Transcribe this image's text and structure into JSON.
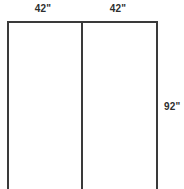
{
  "diagram": {
    "type": "panel-elevation-outline",
    "background_color": "#ffffff",
    "line_color": "#3a3a3a",
    "line_width_px": 2,
    "text_color": "#2e2e2e",
    "labels": {
      "width_left": "42\"",
      "width_right": "42\"",
      "height_right": "92\""
    },
    "panels": [
      {
        "name": "left-panel",
        "width": "42\"",
        "height": "92\""
      },
      {
        "name": "right-panel",
        "width": "42\"",
        "height": "92\""
      }
    ],
    "geometry": {
      "left_edge_x": 8,
      "center_divider_x": 82,
      "right_edge_x": 157,
      "top_edge_y": 22,
      "bottom_cropped": true,
      "bottom_y": 189
    }
  }
}
